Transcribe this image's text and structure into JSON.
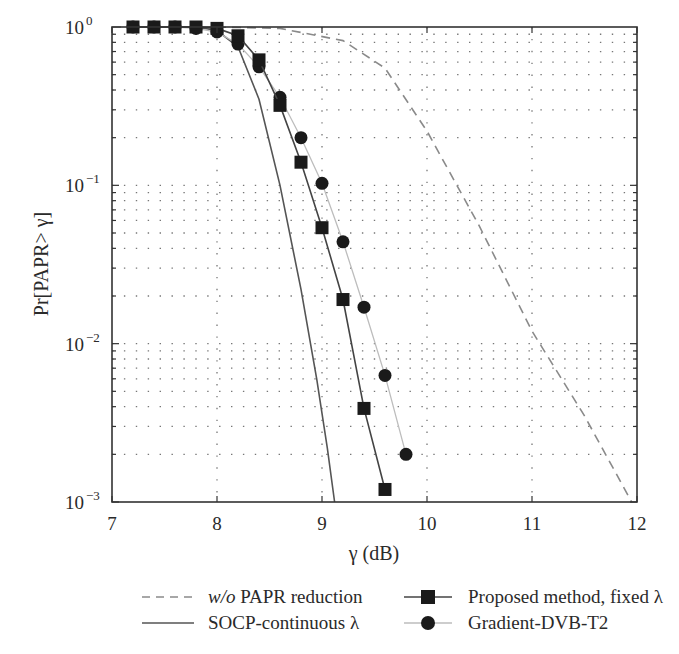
{
  "chart_data": {
    "type": "line",
    "title": "",
    "xlabel": "γ (dB)",
    "ylabel": "Pr[PAPR> γ]",
    "xlim": [
      7,
      12
    ],
    "ylim": [
      0.001,
      1
    ],
    "yscale": "log",
    "xticks": [
      7,
      8,
      9,
      10,
      11,
      12
    ],
    "xtick_labels": [
      "7",
      "8",
      "9",
      "10",
      "11",
      "12"
    ],
    "yticks": [
      1,
      0.1,
      0.01,
      0.001
    ],
    "ytick_labels": [
      [
        "10",
        "0"
      ],
      [
        "10",
        "−1"
      ],
      [
        "10",
        "−2"
      ],
      [
        "10",
        "−3"
      ]
    ],
    "grid": "dotted",
    "legend_position": "below",
    "series": [
      {
        "name": "w/o PAPR reduction",
        "style": "dashed",
        "color": "#8a8a8a",
        "marker": "none",
        "x": [
          7.0,
          8.0,
          8.6,
          9.2,
          9.6,
          10.0,
          10.5,
          11.0,
          11.5,
          11.95
        ],
        "y": [
          1.0,
          1.0,
          0.98,
          0.82,
          0.55,
          0.22,
          0.055,
          0.012,
          0.0035,
          0.001
        ]
      },
      {
        "name": "SOCP-continuous λ",
        "style": "solid",
        "color": "#555555",
        "marker": "none",
        "x": [
          7.2,
          7.6,
          7.8,
          8.0,
          8.2,
          8.4,
          8.6,
          8.8,
          8.95,
          9.05,
          9.12
        ],
        "y": [
          1.0,
          1.0,
          1.0,
          0.95,
          0.75,
          0.35,
          0.1,
          0.022,
          0.006,
          0.0022,
          0.001
        ]
      },
      {
        "name": "Proposed method, fixed λ",
        "style": "solid",
        "color": "#444444",
        "marker": "square",
        "x": [
          7.2,
          7.4,
          7.6,
          7.8,
          8.0,
          8.2,
          8.4,
          8.6,
          8.8,
          9.0,
          9.2,
          9.4,
          9.6
        ],
        "y": [
          1.0,
          1.0,
          1.0,
          1.0,
          0.98,
          0.88,
          0.62,
          0.32,
          0.14,
          0.054,
          0.019,
          0.0039,
          0.0012
        ]
      },
      {
        "name": "Gradient-DVB-T2",
        "style": "solid",
        "color": "#bdbdbd",
        "marker": "circle",
        "x": [
          7.2,
          7.4,
          7.6,
          7.8,
          8.0,
          8.2,
          8.4,
          8.6,
          8.8,
          9.0,
          9.2,
          9.4,
          9.6,
          9.8
        ],
        "y": [
          1.0,
          1.0,
          1.0,
          0.98,
          0.93,
          0.78,
          0.56,
          0.36,
          0.2,
          0.103,
          0.044,
          0.017,
          0.0063,
          0.002
        ]
      }
    ]
  },
  "legend": {
    "items": [
      {
        "italic": "w/o",
        "text": " PAPR reduction"
      },
      {
        "text": "SOCP-continuous λ"
      },
      {
        "text": "Proposed method, fixed λ"
      },
      {
        "text": "Gradient-DVB-T2"
      }
    ]
  },
  "colors": {
    "axis": "#333333",
    "grid": "#777777"
  }
}
